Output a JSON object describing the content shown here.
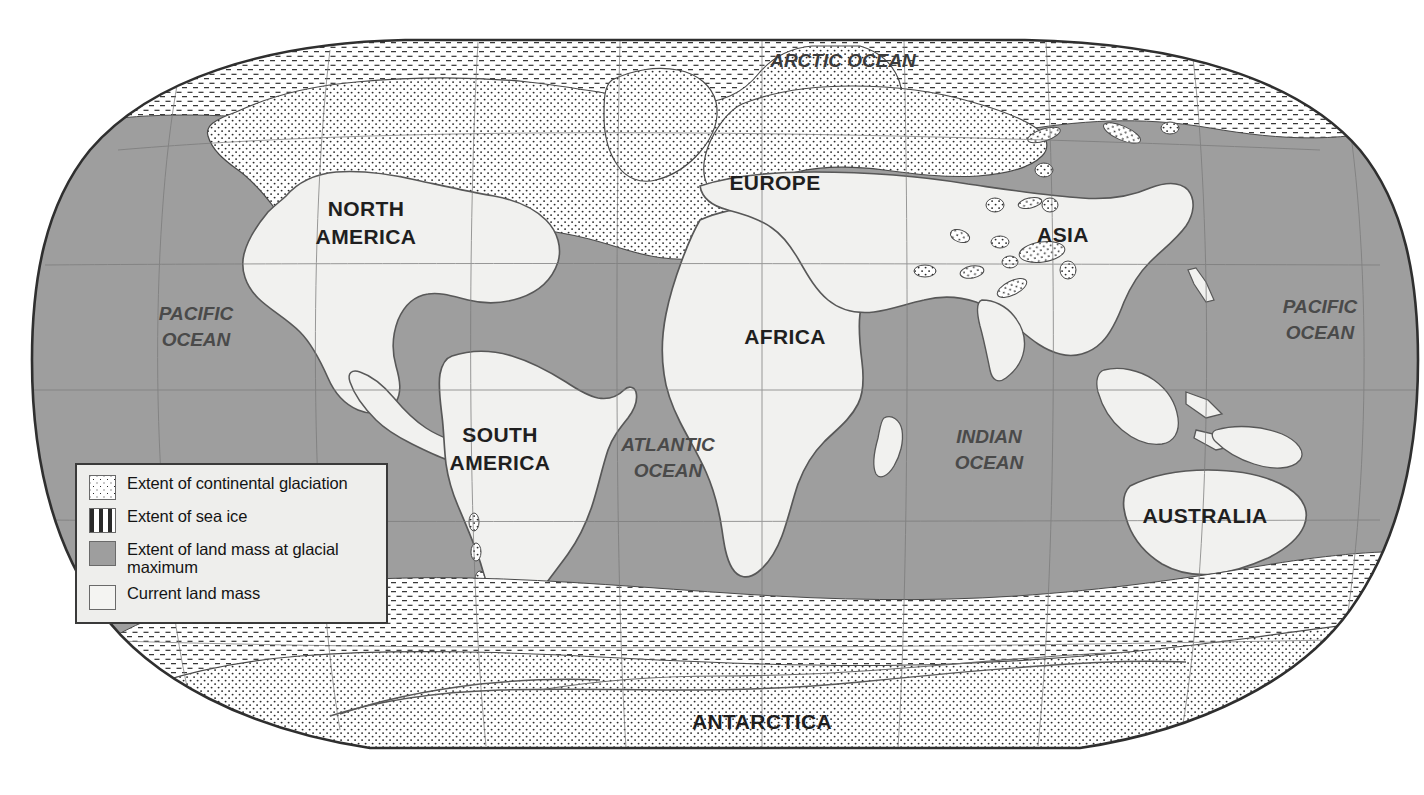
{
  "figure": {
    "type": "thematic world map",
    "projection": "pseudocylindrical (Robinson-style) world projection"
  },
  "colors": {
    "ocean_glacial_max": "#9e9e9e",
    "current_land_mass": "#f1f1ef",
    "continental_glaciation": "#ffffff",
    "sea_ice": "#ffffff",
    "outline": "#4a4a4a",
    "border": "#2f2f2f",
    "label_continent": "#1f1f1f",
    "label_ocean": "#4a4a4a",
    "legend_background": "#eeeeec",
    "page_background": "#ffffff"
  },
  "legend": {
    "items": [
      {
        "swatch": "dotted-white-swatch",
        "label": "Extent of continental glaciation",
        "pattern": "dots"
      },
      {
        "swatch": "dashed-white-swatch",
        "label": "Extent of sea ice",
        "pattern": "dashes"
      },
      {
        "swatch": "solid-gray-swatch",
        "label": "Extent of land mass at glacial maximum",
        "pattern": "solid-gray"
      },
      {
        "swatch": "plain-white-swatch",
        "label": "Current land mass",
        "pattern": "plain"
      }
    ]
  },
  "continent_labels": [
    {
      "name": "north-america",
      "lines": [
        "NORTH",
        "AMERICA"
      ],
      "x": 366,
      "y": 216
    },
    {
      "name": "europe",
      "lines": [
        "EUROPE"
      ],
      "x": 775,
      "y": 190
    },
    {
      "name": "asia",
      "lines": [
        "ASIA"
      ],
      "x": 1063,
      "y": 242
    },
    {
      "name": "africa",
      "lines": [
        "AFRICA"
      ],
      "x": 785,
      "y": 344
    },
    {
      "name": "south-america",
      "lines": [
        "SOUTH",
        "AMERICA"
      ],
      "x": 500,
      "y": 442
    },
    {
      "name": "australia",
      "lines": [
        "AUSTRALIA"
      ],
      "x": 1205,
      "y": 523
    },
    {
      "name": "antarctica",
      "lines": [
        "ANTARCTICA"
      ],
      "x": 762,
      "y": 729
    }
  ],
  "ocean_labels": [
    {
      "name": "arctic-ocean",
      "lines": [
        "ARCTIC OCEAN"
      ],
      "x": 843,
      "y": 67
    },
    {
      "name": "pacific-ocean-east",
      "lines": [
        "PACIFIC",
        "OCEAN"
      ],
      "x": 196,
      "y": 320
    },
    {
      "name": "pacific-ocean-west",
      "lines": [
        "PACIFIC",
        "OCEAN"
      ],
      "x": 1320,
      "y": 313
    },
    {
      "name": "atlantic-ocean",
      "lines": [
        "ATLANTIC",
        "OCEAN"
      ],
      "x": 668,
      "y": 451
    },
    {
      "name": "indian-ocean",
      "lines": [
        "INDIAN",
        "OCEAN"
      ],
      "x": 989,
      "y": 443
    }
  ],
  "graticule": {
    "visible": true,
    "latitude_lines": 4,
    "longitude_lines": 9,
    "style": "thin gray lines"
  }
}
